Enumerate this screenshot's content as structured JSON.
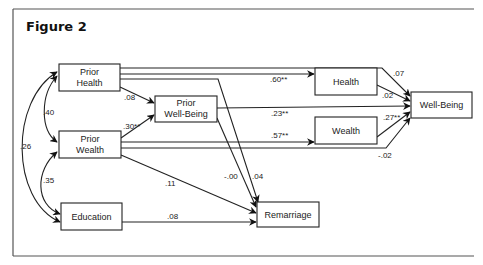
{
  "figure": {
    "title": "Figure 2"
  },
  "nodes": {
    "prior_health": {
      "line1": "Prior",
      "line2": "Health"
    },
    "prior_wealth": {
      "line1": "Prior",
      "line2": "Wealth"
    },
    "prior_wellbeing": {
      "line1": "Prior",
      "line2": "Well-Being"
    },
    "education": {
      "label": "Education"
    },
    "health": {
      "label": "Health"
    },
    "wealth": {
      "label": "Wealth"
    },
    "wellbeing": {
      "label": "Well-Being"
    },
    "remarriage": {
      "label": "Remarriage"
    }
  },
  "correlations": {
    "prior_health_prior_wealth": ".40",
    "prior_health_education": ".26",
    "prior_wealth_education": ".35"
  },
  "paths": {
    "prior_health_to_prior_wellbeing": ".08",
    "prior_wealth_to_prior_wellbeing": ".30**",
    "prior_health_to_health": ".60**",
    "prior_wellbeing_to_wellbeing": ".23**",
    "prior_wealth_to_wealth": ".57**",
    "prior_health_to_wellbeing": ".07",
    "health_to_wellbeing": ".02",
    "wealth_to_wellbeing": ".27**",
    "prior_wealth_to_wellbeing": "-.02",
    "prior_wellbeing_to_remarriage": "-.00",
    "prior_health_to_remarriage": ".04",
    "prior_wealth_to_remarriage": ".11",
    "education_to_remarriage": ".08"
  }
}
